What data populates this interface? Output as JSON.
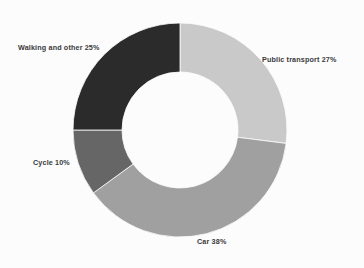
{
  "background_color": "#fcfcfd",
  "label_color": "#3a3a3a",
  "chart_data": {
    "type": "pie",
    "variant": "donut",
    "title": "",
    "subtitle": "",
    "xlabel": "",
    "ylabel": "",
    "legend": "none",
    "grid": false,
    "labels_position": "outside",
    "units": "percent",
    "total": 100,
    "start_angle_deg": 0,
    "direction": "clockwise",
    "center_x": 180,
    "center_y": 130,
    "outer_radius": 107,
    "inner_radius": 58,
    "categories": [
      "Public transport",
      "Car",
      "Cycle",
      "Walking and other"
    ],
    "values": [
      27,
      38,
      10,
      25
    ],
    "colors": [
      "#c9c9c9",
      "#a0a0a0",
      "#666666",
      "#2b2b2b"
    ],
    "slices": [
      {
        "name": "Public transport",
        "value": 27,
        "label": "Public transport 27%",
        "color": "#c9c9c9",
        "start_angle_deg": 0,
        "end_angle_deg": 97.2
      },
      {
        "name": "Car",
        "value": 38,
        "label": "Car 38%",
        "color": "#a0a0a0",
        "start_angle_deg": 97.2,
        "end_angle_deg": 234.0
      },
      {
        "name": "Cycle",
        "value": 10,
        "label": "Cycle 10%",
        "color": "#666666",
        "start_angle_deg": 234.0,
        "end_angle_deg": 270.0
      },
      {
        "name": "Walking and other",
        "value": 25,
        "label": "Walking and other 25%",
        "color": "#2b2b2b",
        "start_angle_deg": 270.0,
        "end_angle_deg": 360.0
      }
    ]
  }
}
